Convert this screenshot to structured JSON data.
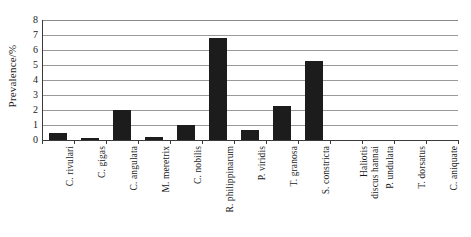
{
  "chart_data": {
    "type": "bar",
    "title": "",
    "xlabel": "",
    "ylabel": "Prevalence/%",
    "ylim": [
      0,
      8
    ],
    "ytick_labels": [
      "8",
      "7",
      "6",
      "5",
      "4",
      "3",
      "2",
      "1",
      "0"
    ],
    "ytick_values": [
      8,
      7,
      6,
      5,
      4,
      3,
      2,
      1,
      0
    ],
    "grid": true,
    "grid_axis": "y",
    "legend": "none",
    "bar_color": "#1c1c1c",
    "categories": [
      "C. rivulari",
      "C. gigas",
      "C. angulata",
      "M. meretrix",
      "C. nobilis",
      "R. philippinarum",
      "P. viridis",
      "T. granosa",
      "S. constricta",
      "Haliotis discus hannai",
      "P. undulata",
      "T. dorsatus",
      "C. aniquate"
    ],
    "category_lines": [
      [
        "C. rivulari"
      ],
      [
        "C. gigas"
      ],
      [
        "C. angulata"
      ],
      [
        "M. meretrix"
      ],
      [
        "C. nobilis"
      ],
      [
        "R. philippinarum"
      ],
      [
        "P. viridis"
      ],
      [
        "T. granosa"
      ],
      [
        "S. constricta"
      ],
      [
        "Haliotis",
        "discus hannai"
      ],
      [
        "P. undulata"
      ],
      [
        "T. dorsatus"
      ],
      [
        "C. aniquate"
      ]
    ],
    "values": [
      0.45,
      0.13,
      2.02,
      0.2,
      0.97,
      6.78,
      0.68,
      2.27,
      5.25,
      0,
      0,
      0,
      0
    ],
    "series": [
      {
        "name": "Prevalence",
        "values": [
          0.45,
          0.13,
          2.02,
          0.2,
          0.97,
          6.78,
          0.68,
          2.27,
          5.25,
          0,
          0,
          0,
          0
        ]
      }
    ]
  }
}
